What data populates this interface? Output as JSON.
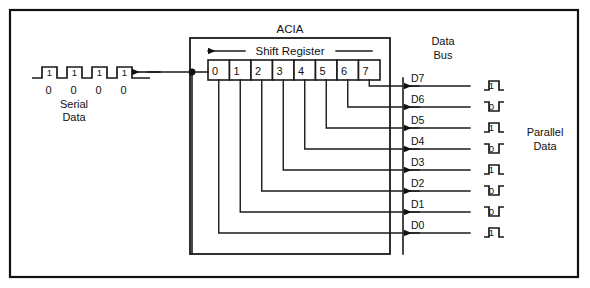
{
  "figure": {
    "device_label": "ACIA",
    "register_label": "Shift Register",
    "serial_label_line1": "Serial",
    "serial_label_line2": "Data",
    "databus_label_line1": "Data",
    "databus_label_line2": "Bus",
    "parallel_label_line1": "Parallel",
    "parallel_label_line2": "Data"
  },
  "register": {
    "cells": [
      "0",
      "1",
      "2",
      "3",
      "4",
      "5",
      "6",
      "7"
    ]
  },
  "data_bus": {
    "lines": [
      {
        "name": "D7",
        "value": "1"
      },
      {
        "name": "D6",
        "value": "0"
      },
      {
        "name": "D5",
        "value": "1"
      },
      {
        "name": "D4",
        "value": "0"
      },
      {
        "name": "D3",
        "value": "1"
      },
      {
        "name": "D2",
        "value": "0"
      },
      {
        "name": "D1",
        "value": "0"
      },
      {
        "name": "D0",
        "value": "1"
      }
    ]
  },
  "serial_stream": {
    "high_bits": [
      "1",
      "1",
      "1",
      "1"
    ],
    "low_bits": [
      "0",
      "0",
      "0",
      "0"
    ]
  },
  "colors": {
    "ink": "#111111",
    "background": "#ffffff"
  }
}
